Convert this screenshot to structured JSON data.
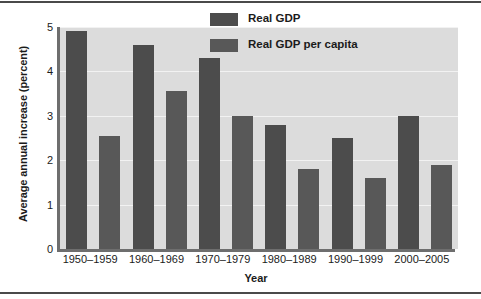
{
  "chart_data": {
    "type": "bar",
    "title": "",
    "xlabel": "Year",
    "ylabel": "Average annual increase (percent)",
    "categories": [
      "1950–1959",
      "1960–1969",
      "1970–1979",
      "1980–1989",
      "1990–1999",
      "2000–2005"
    ],
    "series": [
      {
        "name": "Real GDP",
        "color": "#4c4c4c",
        "values": [
          4.9,
          4.6,
          4.3,
          2.8,
          2.5,
          3.0
        ]
      },
      {
        "name": "Real GDP per capita",
        "color": "#585858",
        "values": [
          2.55,
          3.57,
          3.0,
          1.8,
          1.6,
          1.9
        ]
      }
    ],
    "ylim": [
      0,
      5
    ],
    "yticks": [
      0,
      1,
      2,
      3,
      4,
      5
    ],
    "ytick_labels": [
      "0",
      "1",
      "2",
      "3",
      "4",
      "5"
    ],
    "grid": true,
    "grid_axis": "y",
    "legend_position": "top-right",
    "plot_background": "#dcdcdc",
    "gridline_color": "#f2f2f2",
    "axis_color": "#6e6e6e",
    "figure_background": "#ffffff",
    "text_color": "#1b1b1b"
  },
  "legend": {
    "entries": [
      {
        "label": "Real GDP",
        "color": "#4c4c4c"
      },
      {
        "label": "Real GDP per capita",
        "color": "#585858"
      }
    ]
  },
  "axes": {
    "y_title": "Average annual increase (percent)",
    "x_title": "Year"
  }
}
